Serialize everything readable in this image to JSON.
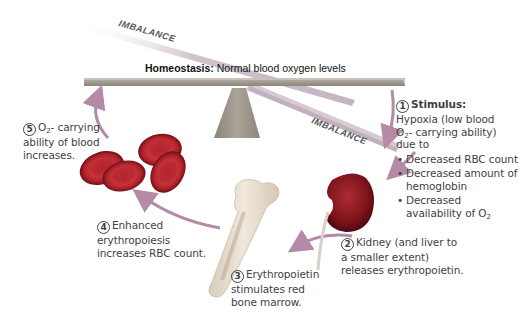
{
  "diagram": {
    "homeostasis": {
      "label": "Homeostasis:",
      "text": "Normal blood oxygen levels"
    },
    "imbalance_labels": [
      "IMBALANCE",
      "IMBALANCE"
    ],
    "steps": [
      {
        "number": "1",
        "heading": "Stimulus:",
        "text_lines": [
          "Hypoxia (low blood",
          "O2- carrying ability)",
          "due to"
        ],
        "bullets": [
          "Decreased RBC count",
          "Decreased amount of hemoglobin",
          "Decreased availability of O2"
        ]
      },
      {
        "number": "2",
        "text_lines": [
          "Kidney (and liver to",
          "a smaller extent)",
          "releases erythropoietin."
        ]
      },
      {
        "number": "3",
        "text_lines": [
          "Erythropoietin",
          "stimulates red",
          "bone marrow."
        ]
      },
      {
        "number": "4",
        "text_lines": [
          "Enhanced",
          "erythropoiesis",
          "increases RBC count."
        ]
      },
      {
        "number": "5",
        "text_lines": [
          "O2- carrying",
          "ability of blood",
          "increases."
        ]
      }
    ],
    "colors": {
      "plank": "#a9a39a",
      "imbalance_plank": "#c9b8c4",
      "fulcrum": "#9c968d",
      "arrow": "#b48aa6",
      "rbc": "#b3222a",
      "kidney": "#8e1a22",
      "bone": "#e8dccb"
    }
  }
}
